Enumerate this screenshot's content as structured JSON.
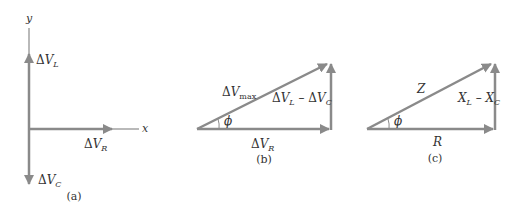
{
  "colors": {
    "arrow": "#8a8a8a",
    "text": "#333333",
    "background": "#ffffff"
  },
  "panel_a": {
    "caption": "(a)",
    "y_axis_label": "y",
    "x_axis_label": "x",
    "vectors": [
      {
        "name": "ΔV_L",
        "delta": "Δ",
        "main": "V",
        "sub": "L",
        "direction": "up"
      },
      {
        "name": "ΔV_R",
        "delta": "Δ",
        "main": "V",
        "sub": "R",
        "direction": "right"
      },
      {
        "name": "ΔV_C",
        "delta": "Δ",
        "main": "V",
        "sub": "C",
        "direction": "down"
      }
    ]
  },
  "panel_b": {
    "caption": "(b)",
    "hypotenuse": {
      "delta": "Δ",
      "main": "V",
      "sub": "max"
    },
    "base": {
      "delta": "Δ",
      "main": "V",
      "sub": "R"
    },
    "vertical": {
      "d1": "Δ",
      "m1": "V",
      "s1": "L",
      "minus": " – ",
      "d2": "Δ",
      "m2": "V",
      "s2": "C"
    },
    "angle": "ϕ"
  },
  "panel_c": {
    "caption": "(c)",
    "hypotenuse": "Z",
    "base": "R",
    "vertical": {
      "m1": "X",
      "s1": "L",
      "minus": " – ",
      "m2": "X",
      "s2": "C"
    },
    "angle": "ϕ"
  }
}
